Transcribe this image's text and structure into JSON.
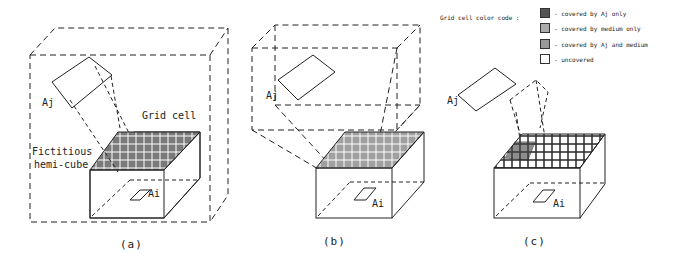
{
  "panels": [
    {
      "id": "a",
      "caption": "(a)",
      "labels": {
        "aj": "Aj",
        "ai": "Ai",
        "grid_cell": "Grid cell",
        "hemicube_line1": "Fictitious",
        "hemicube_line2": "hemi-cube"
      }
    },
    {
      "id": "b",
      "caption": "(b)",
      "labels": {
        "aj": "Aj",
        "ai": "Ai"
      }
    },
    {
      "id": "c",
      "caption": "(c)",
      "labels": {
        "aj": "Aj",
        "ai": "Ai"
      }
    }
  ],
  "legend": {
    "title": "Grid cell color code :",
    "items": [
      {
        "label": "- covered by Aj only",
        "color": "#555555"
      },
      {
        "label": "- covered by medium only",
        "color": "#aaaaaa"
      },
      {
        "label": "- covered by Aj and medium",
        "color": "#999999"
      },
      {
        "label": "- uncovered",
        "color": "#ffffff"
      }
    ]
  },
  "colors": {
    "line": "#222222",
    "grid_a": "#7a7a7a",
    "grid_b": "#8a8a8a",
    "grid_c_dark": "#444444"
  }
}
